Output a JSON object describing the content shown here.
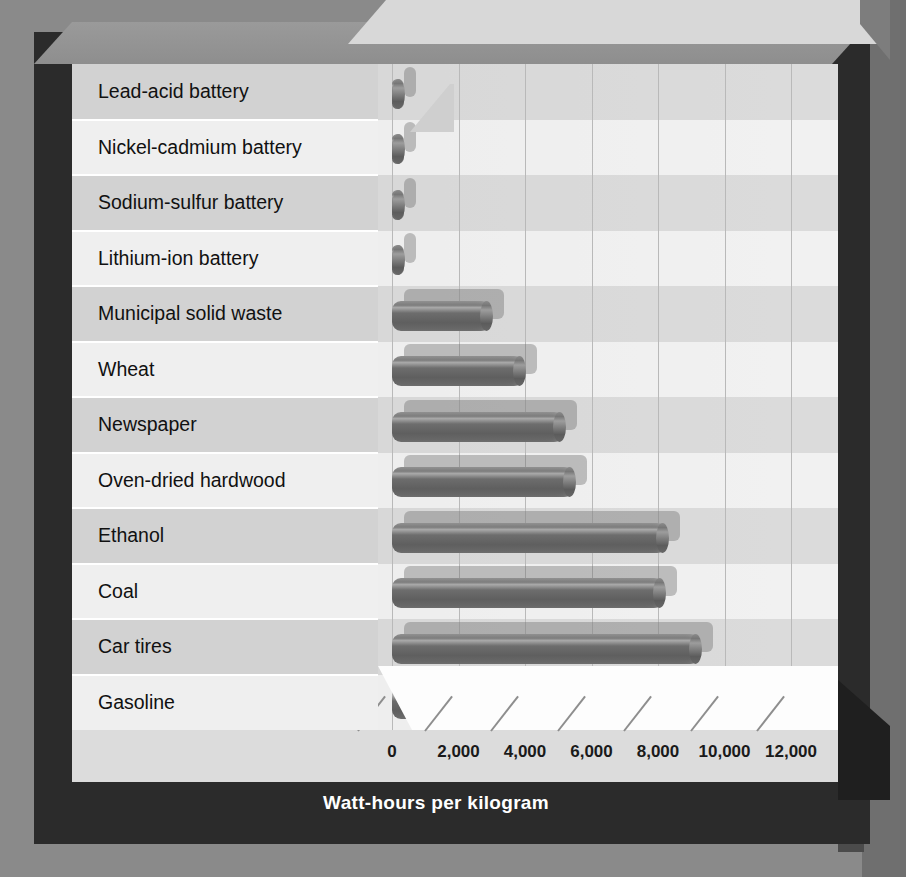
{
  "chart_data": {
    "type": "bar",
    "orientation": "horizontal",
    "title": "",
    "xlabel": "Watt-hours per kilogram",
    "ylabel": "",
    "xlim": [
      0,
      13000
    ],
    "grid": true,
    "legend": false,
    "xticks": [
      "0",
      "2,000",
      "4,000",
      "6,000",
      "8,000",
      "10,000",
      "12,000"
    ],
    "xtick_values": [
      0,
      2000,
      4000,
      6000,
      8000,
      10000,
      12000
    ],
    "categories": [
      "Lead-acid battery",
      "Nickel-cadmium battery",
      "Sodium-sulfur battery",
      "Lithium-ion battery",
      "Municipal solid waste",
      "Wheat",
      "Newspaper",
      "Oven-dried hardwood",
      "Ethanol",
      "Coal",
      "Car tires",
      "Gasoline"
    ],
    "values": [
      35,
      40,
      120,
      200,
      3000,
      4000,
      5200,
      5500,
      8300,
      8200,
      9300,
      12300
    ]
  },
  "axis": {
    "x_title": "Watt-hours per kilogram"
  },
  "colors": {
    "bar": "#6d6d6d",
    "plot_background": "#e9e9e9",
    "label_panel": "#d9d9d9",
    "frame": "#2b2b2b",
    "page_background": "#8a8a8a",
    "gridline": "#b9b9b9",
    "axis_title_text": "#ffffff"
  }
}
